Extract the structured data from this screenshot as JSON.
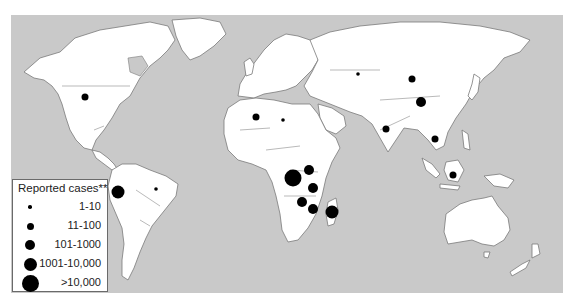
{
  "map": {
    "ocean_color": "#c9c9c9",
    "land_color": "#ffffff",
    "marker_color": "#000000"
  },
  "legend": {
    "title": "Reported cases**",
    "items": [
      {
        "label": "1-10",
        "radius": 1.8
      },
      {
        "label": "11-100",
        "radius": 3.5
      },
      {
        "label": "101-1000",
        "radius": 5
      },
      {
        "label": "1001-10,000",
        "radius": 6.5
      },
      {
        "label": ">10,000",
        "radius": 8.5
      }
    ]
  },
  "markers": [
    {
      "region": "United States",
      "x": 85,
      "y": 97,
      "category": "11-100"
    },
    {
      "region": "Peru",
      "x": 118,
      "y": 192,
      "category": "1001-10,000"
    },
    {
      "region": "Brazil",
      "x": 156,
      "y": 189,
      "category": "1-10"
    },
    {
      "region": "Algeria",
      "x": 256,
      "y": 117,
      "category": "11-100"
    },
    {
      "region": "Libya",
      "x": 283,
      "y": 120,
      "category": "1-10"
    },
    {
      "region": "DR Congo",
      "x": 293,
      "y": 178,
      "category": ">10,000"
    },
    {
      "region": "Uganda",
      "x": 309,
      "y": 170,
      "category": "101-1000"
    },
    {
      "region": "Tanzania",
      "x": 313,
      "y": 188,
      "category": "101-1000"
    },
    {
      "region": "Zambia/Zimbabwe",
      "x": 302,
      "y": 202,
      "category": "101-1000"
    },
    {
      "region": "Mozambique",
      "x": 313,
      "y": 209,
      "category": "101-1000"
    },
    {
      "region": "Madagascar",
      "x": 332,
      "y": 212,
      "category": "1001-10,000"
    },
    {
      "region": "Kazakhstan",
      "x": 358,
      "y": 74,
      "category": "1-10"
    },
    {
      "region": "Mongolia",
      "x": 412,
      "y": 79,
      "category": "11-100"
    },
    {
      "region": "China",
      "x": 421,
      "y": 102,
      "category": "101-1000"
    },
    {
      "region": "India",
      "x": 386,
      "y": 129,
      "category": "11-100"
    },
    {
      "region": "Vietnam",
      "x": 435,
      "y": 139,
      "category": "11-100"
    },
    {
      "region": "Indonesia",
      "x": 453,
      "y": 175,
      "category": "11-100"
    }
  ]
}
